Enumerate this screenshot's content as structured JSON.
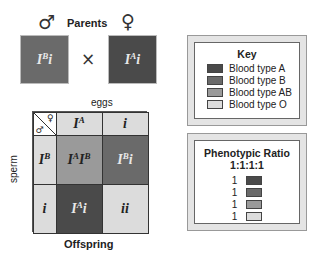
{
  "parents": {
    "title": "Parents",
    "male_symbol": "♂",
    "female_symbol": "♀",
    "cross_symbol": "×",
    "male": {
      "base": "I",
      "sup": "B",
      "allele2": "i",
      "color": "#6a6a6a"
    },
    "female": {
      "base": "I",
      "sup": "A",
      "allele2": "i",
      "color": "#4a4a4a"
    }
  },
  "punnett": {
    "eggs_label": "eggs",
    "sperm_label": "sperm",
    "offspring_label": "Offspring",
    "corner_male": "♂",
    "corner_female": "♀",
    "col_headers": [
      {
        "base": "I",
        "sup": "A",
        "tail": "",
        "color": "#dcdcdc"
      },
      {
        "base": "",
        "sup": "",
        "tail": "i",
        "color": "#dcdcdc"
      }
    ],
    "row_headers": [
      {
        "base": "I",
        "sup": "B",
        "tail": "",
        "color": "#dcdcdc"
      },
      {
        "base": "",
        "sup": "",
        "tail": "i",
        "color": "#dcdcdc"
      }
    ],
    "cells": [
      {
        "p1": "I",
        "s1": "A",
        "p2": "I",
        "s2": "B",
        "tail": "",
        "color": "#9a9a9a",
        "text_color": "#222222"
      },
      {
        "p1": "I",
        "s1": "B",
        "p2": "",
        "s2": "",
        "tail": "i",
        "color": "#6a6a6a",
        "text_color": "#e8e8e8"
      },
      {
        "p1": "I",
        "s1": "A",
        "p2": "",
        "s2": "",
        "tail": "i",
        "color": "#4a4a4a",
        "text_color": "#e8e8e8"
      },
      {
        "p1": "",
        "s1": "",
        "p2": "",
        "s2": "",
        "tail": "ii",
        "color": "#dcdcdc",
        "text_color": "#222222"
      }
    ]
  },
  "key": {
    "title": "Key",
    "items": [
      {
        "label": "Blood type A",
        "color": "#4a4a4a"
      },
      {
        "label": "Blood type B",
        "color": "#6a6a6a"
      },
      {
        "label": "Blood type AB",
        "color": "#9a9a9a"
      },
      {
        "label": "Blood type O",
        "color": "#dcdcdc"
      }
    ]
  },
  "ratio": {
    "title": "Phenotypic Ratio",
    "value": "1:1:1:1",
    "items": [
      {
        "count": "1",
        "color": "#4a4a4a"
      },
      {
        "count": "1",
        "color": "#6a6a6a"
      },
      {
        "count": "1",
        "color": "#9a9a9a"
      },
      {
        "count": "1",
        "color": "#dcdcdc"
      }
    ]
  }
}
